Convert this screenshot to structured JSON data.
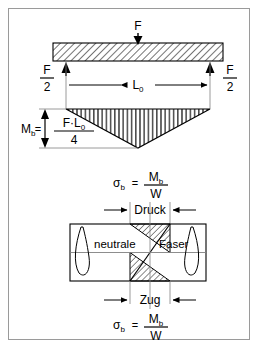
{
  "diagram": {
    "labels": {
      "force": "F",
      "force_half_numerator": "F",
      "force_half_denominator": "2",
      "span": "L",
      "span_subscript": "0",
      "moment_symbol": "M",
      "moment_subscript": "b",
      "equals": "=",
      "moment_numerator_left": "F",
      "moment_numerator_dot": "·",
      "moment_numerator_right": "L",
      "moment_numerator_right_subscript": "0",
      "moment_denominator": "4",
      "sigma_symbol": "σ",
      "sigma_subscript": "b",
      "sigma_numerator": "M",
      "sigma_numerator_subscript": "b",
      "sigma_denominator": "W",
      "compression": "Druck",
      "tension": "Zug",
      "neutral_left": "neutrale",
      "neutral_right": "Faser"
    },
    "formulas": {
      "bending_moment": "Mb = F·L0 / 4",
      "bending_stress": "σb = Mb / W"
    },
    "colors": {
      "line": "#000000",
      "thin_line": "#808080",
      "border": "#9a9a9a",
      "hatch": "#000000",
      "background": "#ffffff"
    },
    "geometry": {
      "beam_left": 44,
      "beam_right": 214,
      "beam_top": 34,
      "beam_bottom": 52,
      "load_x": 129,
      "moment_apex_y": 139,
      "section_top": 215,
      "section_bottom": 272
    }
  }
}
